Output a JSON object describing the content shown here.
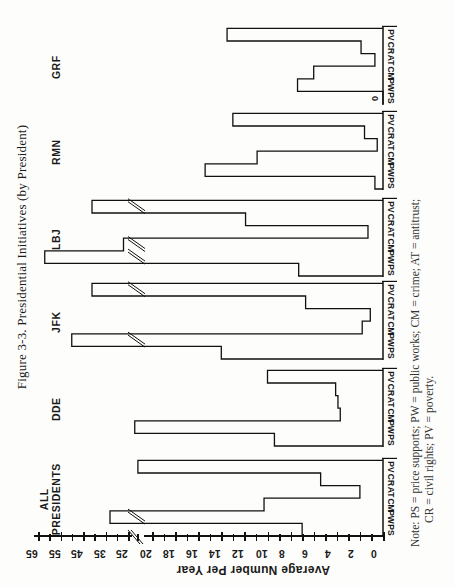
{
  "title": "Figure 3-3.  Presidential Initiatives (by President)",
  "note": {
    "line1": "Note: PS  =  price supports; PW  =  public works; CM  =  crime; AT  =  antitrust;",
    "line2": "CR  =  civil rights; PV  =  poverty."
  },
  "axis": {
    "label": "Average Number  Per  Year",
    "ticks_lower": [
      "0",
      "2",
      "4",
      "6",
      "8",
      "10",
      "12",
      "14",
      "16",
      "18",
      "20"
    ],
    "ticks_upper": [
      "25",
      "35",
      "45",
      "55",
      "65"
    ],
    "break_marker": "//"
  },
  "chart_data": {
    "type": "bar",
    "title": "Figure 3-3. Presidential Initiatives (by President)",
    "orientation": "rotated 90° counter-clockwise (value axis horizontal at bottom of page)",
    "xlabel": "",
    "ylabel": "Average Number Per Year",
    "ylim": [
      0,
      65
    ],
    "axis_break": {
      "from": 20,
      "to": 25
    },
    "y_ticks": [
      0,
      2,
      4,
      6,
      8,
      10,
      12,
      14,
      16,
      18,
      20,
      25,
      35,
      45,
      55,
      65
    ],
    "categories": [
      "PS",
      "PW",
      "CM",
      "AT",
      "CR",
      "PV"
    ],
    "category_legend": {
      "PS": "price supports",
      "PW": "public works",
      "CM": "crime",
      "AT": "antitrust",
      "CR": "civil rights",
      "PV": "poverty"
    },
    "groups": [
      {
        "name": "ALL PRESIDENTS",
        "values": [
          7,
          33,
          10.3,
          2,
          5.4,
          20.6
        ]
      },
      {
        "name": "DDE",
        "values": [
          9.4,
          22,
          3.7,
          3.9,
          4.1,
          10
        ]
      },
      {
        "name": "JFK",
        "values": [
          14,
          50,
          1.8,
          1.1,
          6.7,
          41
        ]
      },
      {
        "name": "LBJ",
        "values": [
          7.3,
          62,
          27,
          1.3,
          11.9,
          41
        ]
      },
      {
        "name": "RMN",
        "values": [
          0.7,
          15.4,
          10.9,
          0.5,
          1.6,
          13
        ]
      },
      {
        "name": "GRF",
        "values": [
          0,
          7.4,
          6,
          0.7,
          1.9,
          13.5
        ]
      }
    ],
    "annotations": [
      "0 (GRF PS)"
    ],
    "grid": false,
    "legend": "none (category abbreviations defined in note)"
  }
}
